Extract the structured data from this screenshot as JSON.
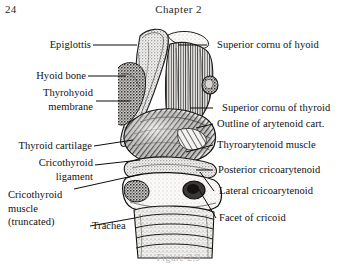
{
  "page": {
    "folio": "24",
    "running_title": "Chapter 2"
  },
  "figure": {
    "caption": "Figure 2.9",
    "style": "black-and-white stipple engraving"
  },
  "labels_left": [
    {
      "id": "epiglottis",
      "lines": [
        "Epiglottis"
      ]
    },
    {
      "id": "hyoid-bone",
      "lines": [
        "Hyoid bone"
      ]
    },
    {
      "id": "thyrohyoid-membrane",
      "lines": [
        "Thyrohyoid",
        "membrane"
      ]
    },
    {
      "id": "thyroid-cartilage",
      "lines": [
        "Thyroid cartilage"
      ]
    },
    {
      "id": "cricothyroid-ligament",
      "lines": [
        "Cricothyroid",
        "ligament"
      ]
    },
    {
      "id": "cricothyroid-muscle",
      "lines": [
        "Cricothyroid",
        "muscle",
        "(truncated)"
      ]
    },
    {
      "id": "trachea",
      "lines": [
        "Trachea"
      ]
    }
  ],
  "labels_right": [
    {
      "id": "superior-cornu-of-hyoid",
      "lines": [
        "Superior cornu of hyoid"
      ]
    },
    {
      "id": "superior-cornu-of-thyroid",
      "lines": [
        "Superior cornu of thyroid"
      ]
    },
    {
      "id": "outline-of-arytenoid-cart",
      "lines": [
        "Outline of arytenoid cart."
      ]
    },
    {
      "id": "thyroarytenoid-muscle",
      "lines": [
        "Thyroarytenoid muscle"
      ]
    },
    {
      "id": "posterior-cricoarytenoid",
      "lines": [
        "Posterior cricoarytenoid"
      ]
    },
    {
      "id": "lateral-cricoarytenoid",
      "lines": [
        "Lateral cricoarytenoid"
      ]
    },
    {
      "id": "facet-of-cricoid",
      "lines": [
        "Facet of cricoid"
      ]
    }
  ],
  "label_text": {
    "epiglottis": "Epiglottis",
    "hyoid_bone": "Hyoid bone",
    "thyrohyoid_1": "Thyrohyoid",
    "thyrohyoid_2": "membrane",
    "thyroid_cartilage": "Thyroid cartilage",
    "cricothyroid_lig_1": "Cricothyroid",
    "cricothyroid_lig_2": "ligament",
    "cricothyroid_m_1": "Cricothyroid",
    "cricothyroid_m_2": "muscle",
    "cricothyroid_m_3": "(truncated)",
    "trachea": "Trachea",
    "superior_cornu_hyoid": "Superior cornu of hyoid",
    "superior_cornu_thyroid": "Superior cornu of thyroid",
    "outline_arytenoid": "Outline of arytenoid cart.",
    "thyroarytenoid_muscle": "Thyroarytenoid muscle",
    "posterior_cricoarytenoid": "Posterior cricoarytenoid",
    "lateral_cricoarytenoid": "Lateral cricoarytenoid",
    "facet_of_cricoid": "Facet of cricoid"
  },
  "colors": {
    "ink": "#101010",
    "paper": "#ffffff",
    "engraving_dark": "#2a2a2a",
    "engraving_mid": "#6f6f6f",
    "engraving_light": "#c4c4c4",
    "caption_faded": "#b9b9b9"
  }
}
